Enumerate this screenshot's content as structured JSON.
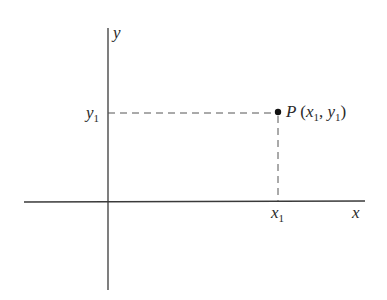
{
  "diagram": {
    "type": "cartesian-coordinate-plane",
    "axes": {
      "x_label": "x",
      "y_label": "y"
    },
    "point": {
      "name": "P",
      "x_symbol": "x",
      "y_symbol": "y",
      "subscript": "1",
      "comma": ", ",
      "open_paren": "(",
      "close_paren": ")"
    },
    "ticks": {
      "x_tick_symbol": "x",
      "x_tick_subscript": "1",
      "y_tick_symbol": "y",
      "y_tick_subscript": "1"
    },
    "colors": {
      "line": "#3a3a3a",
      "dash": "#555555",
      "point": "#111111",
      "text": "#2a2a2a"
    }
  }
}
